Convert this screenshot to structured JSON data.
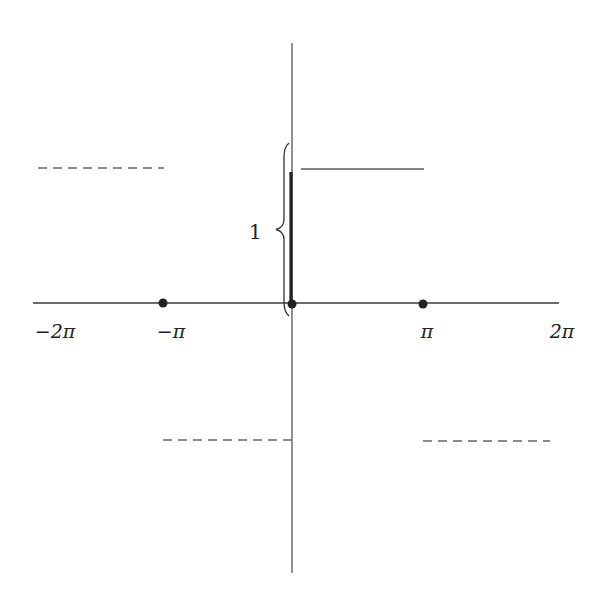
{
  "diagram": {
    "title": "",
    "axes": {
      "x_axis": {
        "x1": 33,
        "x2": 559,
        "y": 303
      },
      "y_axis": {
        "x": 292,
        "y1": 43,
        "y2": 573
      }
    },
    "x_ticks": [
      {
        "label": "−2π",
        "value": "-2pi",
        "x": 55,
        "y": 338
      },
      {
        "label": "−π",
        "value": "-pi",
        "x": 171,
        "y": 338
      },
      {
        "label": "π",
        "value": "pi",
        "x": 427,
        "y": 338
      },
      {
        "label": "2π",
        "value": "2pi",
        "x": 562,
        "y": 338
      }
    ],
    "dots": [
      {
        "name": "dot-minus-pi",
        "x": 163,
        "y": 303,
        "r": 4.5
      },
      {
        "name": "dot-origin",
        "x": 292,
        "y": 304,
        "r": 4.5
      },
      {
        "name": "dot-pi",
        "x": 423,
        "y": 304,
        "r": 4.5
      }
    ],
    "segments": {
      "solid": [
        {
          "name": "upper-solid-segment",
          "x1": 301,
          "x2": 424,
          "y": 169
        }
      ],
      "dashed": [
        {
          "name": "upper-left-dashed-segment",
          "x1": 38,
          "x2": 164,
          "y": 168
        },
        {
          "name": "lower-center-dashed-segment",
          "x1": 163,
          "x2": 292,
          "y": 440
        },
        {
          "name": "lower-right-dashed-segment",
          "x1": 423,
          "x2": 550,
          "y": 441
        }
      ]
    },
    "jump_marker": {
      "x": 291,
      "y1": 172,
      "y2": 302
    },
    "brace": {
      "label": "1",
      "label_x": 249,
      "label_y": 239,
      "x": 284,
      "y1": 143,
      "y2": 316,
      "tip_x": 276
    },
    "colors": {
      "background": "#ffffff",
      "ink": "#222222",
      "axis": "#3a3a3a",
      "segment": "#5a5a5a"
    }
  }
}
